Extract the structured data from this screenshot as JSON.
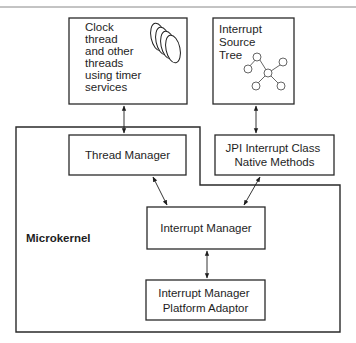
{
  "diagram": {
    "region_label": "Microkernel",
    "boxes": {
      "clock_threads": {
        "lines": [
          "Clock",
          "thread",
          "and other",
          "threads",
          "using timer",
          "services"
        ],
        "icon": "stacked-threads-icon"
      },
      "interrupt_source_tree": {
        "lines": [
          "Interrupt",
          "Source",
          "Tree"
        ],
        "icon": "tree-graph-icon"
      },
      "thread_manager": {
        "lines": [
          "Thread Manager"
        ]
      },
      "jpi_native_methods": {
        "lines": [
          "JPI Interrupt Class",
          "Native Methods"
        ]
      },
      "interrupt_manager": {
        "lines": [
          "Interrupt Manager"
        ]
      },
      "platform_adaptor": {
        "lines": [
          "Interrupt Manager",
          "Platform Adaptor"
        ]
      }
    },
    "connections": [
      {
        "from": "clock_threads",
        "to": "thread_manager",
        "type": "bidirectional"
      },
      {
        "from": "interrupt_source_tree",
        "to": "jpi_native_methods",
        "type": "bidirectional"
      },
      {
        "from": "thread_manager",
        "to": "interrupt_manager",
        "type": "bidirectional"
      },
      {
        "from": "jpi_native_methods",
        "to": "interrupt_manager",
        "type": "bidirectional"
      },
      {
        "from": "interrupt_manager",
        "to": "platform_adaptor",
        "type": "bidirectional"
      }
    ]
  }
}
